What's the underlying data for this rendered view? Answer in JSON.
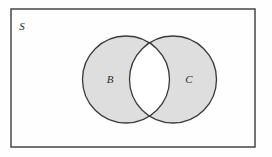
{
  "figure": {
    "type": "venn-diagram",
    "caption": "",
    "background_color": "#fefefe",
    "canvas": {
      "width": 272,
      "height": 157
    }
  },
  "universe": {
    "label": "S",
    "name": "universal-set-rectangle",
    "border_color": "#3a3a3a",
    "fill_color": "#fefefe",
    "x": 11,
    "y": 9,
    "width": 244,
    "height": 138,
    "stroke_width": 1.4,
    "label_x": 22,
    "label_y": 30
  },
  "sets": [
    {
      "label": "B",
      "name": "set-b-circle",
      "cx": 126,
      "cy": 79.5,
      "r": 43.5,
      "fill_color": "#dedede",
      "border_color": "#3a3a3a",
      "stroke_width": 1.3,
      "label_x": 110,
      "label_y": 83
    },
    {
      "label": "C",
      "name": "set-c-circle",
      "cx": 173,
      "cy": 79.5,
      "r": 43.5,
      "fill_color": "#dedede",
      "border_color": "#3a3a3a",
      "stroke_width": 1.3,
      "label_x": 189,
      "label_y": 83
    }
  ],
  "intersection": {
    "name": "set-intersection-region",
    "label": "",
    "fill_color": "#ffffff",
    "shaded": false
  }
}
